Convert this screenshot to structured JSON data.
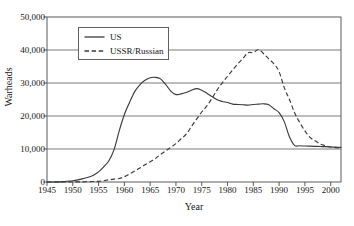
{
  "chart_data": {
    "type": "line",
    "title": "",
    "xlabel": "Year",
    "ylabel": "Warheads",
    "xlim": [
      1945,
      2002
    ],
    "ylim": [
      0,
      50000
    ],
    "grid": "horizontal",
    "legend_position": "upper-left-inside",
    "xticks": [
      1945,
      1950,
      1955,
      1960,
      1965,
      1970,
      1975,
      1980,
      1985,
      1990,
      1995,
      2000
    ],
    "xtick_labels": [
      "1945",
      "1950",
      "1955",
      "1960",
      "1965",
      "1970",
      "1975",
      "1980",
      "1985",
      "1990",
      "1995",
      "2000"
    ],
    "yticks": [
      0,
      10000,
      20000,
      30000,
      40000,
      50000
    ],
    "ytick_labels": [
      "0",
      "10,000",
      "20,000",
      "30,000",
      "40,000",
      "50,000"
    ],
    "series": [
      {
        "name": "US",
        "style": "solid",
        "color": "#3a3a3a",
        "x": [
          1945,
          1946,
          1947,
          1948,
          1949,
          1950,
          1951,
          1952,
          1953,
          1954,
          1955,
          1956,
          1957,
          1958,
          1959,
          1960,
          1961,
          1962,
          1963,
          1964,
          1965,
          1966,
          1967,
          1968,
          1969,
          1970,
          1971,
          1972,
          1973,
          1974,
          1975,
          1976,
          1977,
          1978,
          1979,
          1980,
          1981,
          1982,
          1983,
          1984,
          1985,
          1986,
          1987,
          1988,
          1989,
          1990,
          1991,
          1992,
          1993,
          1994,
          1995,
          1996,
          1997,
          1998,
          1999,
          2000,
          2001,
          2002
        ],
        "y": [
          6,
          11,
          32,
          110,
          235,
          369,
          640,
          1005,
          1436,
          2063,
          3057,
          4618,
          6444,
          9822,
          15468,
          20434,
          24111,
          27387,
          29459,
          30817,
          31600,
          31700,
          31255,
          29561,
          27552,
          26490,
          26720,
          27100,
          27800,
          28300,
          27800,
          26900,
          25900,
          24900,
          24400,
          24100,
          23600,
          23500,
          23400,
          23300,
          23500,
          23600,
          23700,
          23400,
          22200,
          21000,
          18300,
          13700,
          11100,
          10980,
          10900,
          10850,
          10800,
          10750,
          10700,
          10600,
          10550,
          10500
        ]
      },
      {
        "name": "USSR/Russian",
        "style": "dashed",
        "color": "#3a3a3a",
        "x": [
          1945,
          1949,
          1950,
          1951,
          1952,
          1953,
          1954,
          1955,
          1956,
          1957,
          1958,
          1959,
          1960,
          1961,
          1962,
          1963,
          1964,
          1965,
          1966,
          1967,
          1968,
          1969,
          1970,
          1971,
          1972,
          1973,
          1974,
          1975,
          1976,
          1977,
          1978,
          1979,
          1980,
          1981,
          1982,
          1983,
          1984,
          1985,
          1986,
          1987,
          1988,
          1989,
          1990,
          1991,
          1992,
          1993,
          1994,
          1995,
          1996,
          1997,
          1998,
          1999,
          2000,
          2001,
          2002
        ],
        "y": [
          0,
          1,
          5,
          25,
          50,
          120,
          150,
          200,
          426,
          660,
          869,
          1060,
          1605,
          2471,
          3322,
          4238,
          5221,
          6129,
          7089,
          8339,
          9399,
          10538,
          11643,
          13092,
          14478,
          16840,
          19054,
          21205,
          23044,
          25393,
          27935,
          30062,
          32049,
          33952,
          35804,
          37431,
          39197,
          39197,
          40159,
          38859,
          37333,
          35805,
          33417,
          28595,
          25000,
          21000,
          18000,
          15500,
          13500,
          12500,
          11500,
          11000,
          10600,
          10400,
          10300
        ]
      }
    ],
    "annotations": {
      "us_peak_year": 1966,
      "us_peak_value": 31700,
      "ussr_peak_year": 1986,
      "ussr_peak_value": 40159,
      "crossover_year": 1978
    }
  },
  "legend": {
    "entries": [
      {
        "label": "US",
        "style": "solid"
      },
      {
        "label": "USSR/Russian",
        "style": "dashed"
      }
    ]
  },
  "colors": {
    "line": "#3a3a3a",
    "gridline": "#6b6b6b",
    "axis": "#4a4a4a",
    "background": "#ffffff",
    "text": "#151515"
  }
}
